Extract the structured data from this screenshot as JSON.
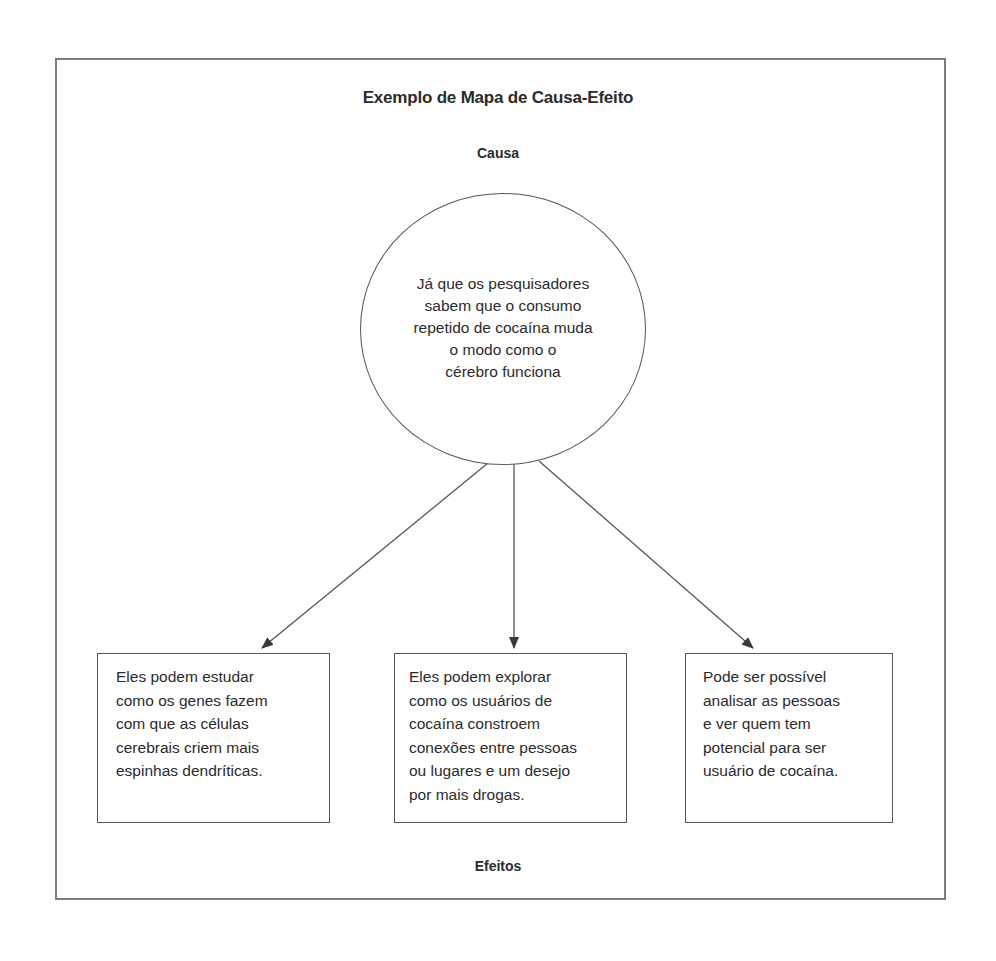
{
  "diagram": {
    "title": "Exemplo de Mapa de Causa-Efeito",
    "cause_label": "Causa",
    "effects_label": "Efeitos",
    "cause": {
      "lines": [
        "Já que os pesquisadores",
        "sabem que o consumo",
        "repetido de cocaína muda",
        "o modo como o",
        "cérebro funciona"
      ]
    },
    "effects": [
      {
        "lines": [
          "Eles podem estudar",
          "como os genes fazem",
          "com que as células",
          "cerebrais criem mais",
          "espinhas dendríticas."
        ]
      },
      {
        "lines": [
          "Eles podem explorar",
          "como os usuários de",
          "cocaína constroem",
          "conexões entre pessoas",
          "ou lugares e um desejo",
          "por mais drogas."
        ]
      },
      {
        "lines": [
          "Pode ser possível",
          "analisar as pessoas",
          "e ver quem tem",
          "potencial para ser",
          "usuário de cocaína."
        ]
      }
    ],
    "colors": {
      "line": "#555555",
      "frame": "#7a7a7a",
      "text": "#2b2b2b"
    }
  }
}
